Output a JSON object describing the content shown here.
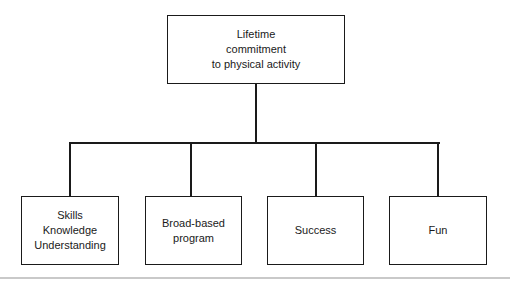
{
  "diagram": {
    "type": "hierarchy-tree",
    "orientation": "top-down",
    "colors": {
      "box_border": "#1a1a1a",
      "box_fill": "#ffffff",
      "connector": "#1a1a1a",
      "text": "#1a1a1a",
      "baseline_rule": "#c9c9c9",
      "background": "#ffffff"
    },
    "root": {
      "id": "root-node",
      "label": "Lifetime\ncommitment\nto physical activity",
      "lines": [
        "Lifetime",
        "commitment",
        "to physical activity"
      ],
      "x": 167,
      "y": 15,
      "width": 178,
      "height": 69
    },
    "children": [
      {
        "id": "node-skills",
        "label": "Skills\nKnowledge\nUnderstanding",
        "lines": [
          "Skills",
          "Knowledge",
          "Understanding"
        ],
        "x": 21,
        "y": 196,
        "width": 98,
        "height": 69
      },
      {
        "id": "node-broad-based-program",
        "label": "Broad-based\nprogram",
        "lines": [
          "Broad-based",
          "program"
        ],
        "x": 145,
        "y": 196,
        "width": 97,
        "height": 69
      },
      {
        "id": "node-success",
        "label": "Success",
        "lines": [
          "Success"
        ],
        "x": 267,
        "y": 196,
        "width": 97,
        "height": 69
      },
      {
        "id": "node-fun",
        "label": "Fun",
        "lines": [
          "Fun"
        ],
        "x": 389,
        "y": 196,
        "width": 98,
        "height": 69
      }
    ],
    "connectors": {
      "root_stem": {
        "x": 255,
        "y": 84,
        "length": 58
      },
      "bus": {
        "x": 69,
        "y": 142,
        "length": 371
      },
      "drops": [
        {
          "x": 69,
          "y": 142,
          "length": 54
        },
        {
          "x": 191,
          "y": 142,
          "length": 54
        },
        {
          "x": 316,
          "y": 142,
          "length": 54
        },
        {
          "x": 438,
          "y": 142,
          "length": 54
        }
      ]
    },
    "baseline_rule": {
      "y": 277
    }
  }
}
